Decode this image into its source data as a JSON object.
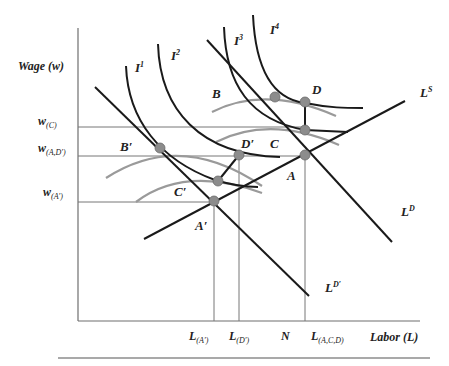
{
  "diagram": {
    "y_axis_label": "Wage (w)",
    "x_axis_label": "Labor (L)",
    "wage_levels": [
      {
        "base": "w",
        "sub": "(C)"
      },
      {
        "base": "w",
        "sub": "(A,D′)"
      },
      {
        "base": "w",
        "sub": "(A′)"
      }
    ],
    "labor_levels": [
      {
        "base": "L",
        "sub": "(A′)"
      },
      {
        "base": "L",
        "sub": "(D′)"
      },
      {
        "base": "N",
        "sub": ""
      },
      {
        "base": "L",
        "sub": "(A,C,D)"
      }
    ],
    "indifference_curves": [
      {
        "base": "I",
        "sup": "1"
      },
      {
        "base": "I",
        "sup": "2"
      },
      {
        "base": "I",
        "sup": "3"
      },
      {
        "base": "I",
        "sup": "4"
      }
    ],
    "lines": {
      "supply": {
        "base": "L",
        "sup": "S"
      },
      "demand": {
        "base": "L",
        "sup": "D"
      },
      "demand_shifted": {
        "base": "L",
        "sup": "D′"
      }
    },
    "points": {
      "A": "A",
      "A_prime": "A′",
      "B": "B",
      "B_prime": "B′",
      "C": "C",
      "C_prime": "C′",
      "D": "D",
      "D_prime": "D′"
    },
    "colors": {
      "curve": "#1a1a1a",
      "iso_curve": "#9a9a9a",
      "guide": "#777777",
      "point": "#8c8c8c"
    }
  }
}
